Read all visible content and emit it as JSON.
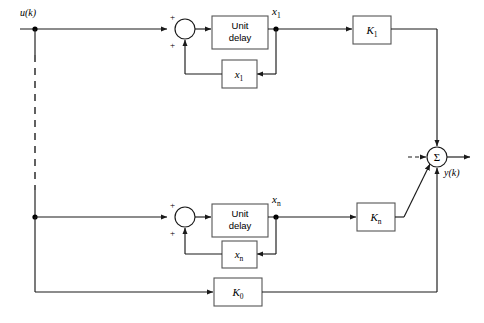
{
  "diagram": {
    "background_color": "#ffffff",
    "line_color": "#1a1a1a",
    "box_stroke_color": "#555555",
    "width": 484,
    "height": 323
  },
  "io": {
    "input_label": "u(k)",
    "output_label": "y(k)"
  },
  "blocks": {
    "unit_delay_top": {
      "line1": "Unit",
      "line2": "delay"
    },
    "unit_delay_bottom": {
      "line1": "Unit",
      "line2": "delay"
    },
    "state_feedback_top": {
      "base": "x",
      "sub": "1"
    },
    "state_feedback_bottom": {
      "base": "x",
      "sub": "n"
    },
    "gain_top": {
      "base": "K",
      "sub": "1"
    },
    "gain_bottom": {
      "base": "K",
      "sub": "n"
    },
    "gain_direct": {
      "base": "K",
      "sub": "0"
    }
  },
  "signals": {
    "state_top": {
      "base": "x",
      "sub": "1"
    },
    "state_bottom": {
      "base": "x",
      "sub": "n"
    }
  },
  "summing_junctions": {
    "top": {
      "sign_upper": "+",
      "sign_lower": "+"
    },
    "bottom": {
      "sign_upper": "+",
      "sign_lower": "+"
    },
    "output": {
      "symbol": "Σ"
    }
  },
  "repetition_indicator": {
    "style": "dashed",
    "meaning": "ellipsis for intermediate identical stages"
  }
}
